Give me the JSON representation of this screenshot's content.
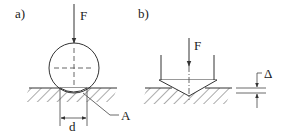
{
  "panels": [
    {
      "label": "a)",
      "force_label": "F",
      "dimension_label": "d",
      "point_label": "A",
      "description": "Sphere pressed onto hatched surface; contact diameter d, contact point A"
    },
    {
      "label": "b)",
      "force_label": "F",
      "dimension_label": "Δ",
      "description": "Conical/pyramidal indenter pressed into hatched surface; penetration depth Δ"
    }
  ]
}
